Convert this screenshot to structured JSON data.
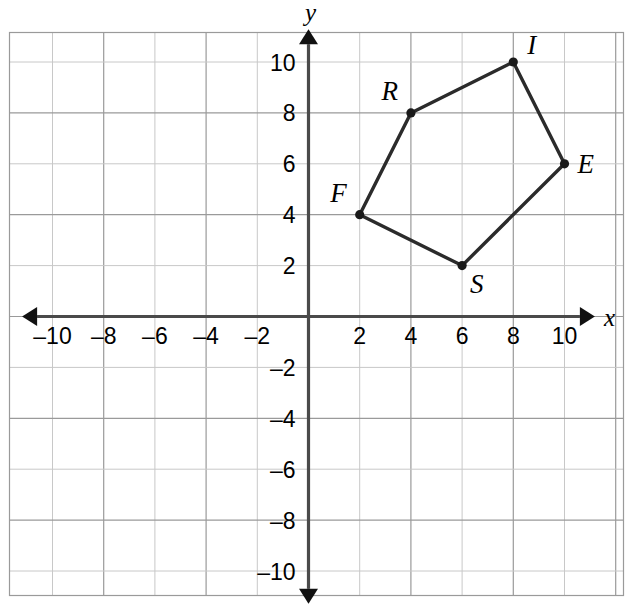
{
  "chart_data": {
    "type": "scatter",
    "title": "",
    "xlabel": "x",
    "ylabel": "y",
    "xlim": [
      -11,
      11
    ],
    "ylim": [
      -11,
      11
    ],
    "grid": true,
    "grid_step": 2,
    "legend": "none",
    "x_ticks": [
      -10,
      -8,
      -6,
      -4,
      -2,
      2,
      4,
      6,
      8,
      10
    ],
    "y_ticks": [
      -10,
      -8,
      -6,
      -4,
      -2,
      2,
      4,
      6,
      8,
      10
    ],
    "x_tick_labels": [
      "–10",
      "–8",
      "–6",
      "–4",
      "–2",
      "2",
      "4",
      "6",
      "8",
      "10"
    ],
    "y_tick_labels": [
      "–10",
      "–8",
      "–6",
      "–4",
      "–2",
      "2",
      "4",
      "6",
      "8",
      "10"
    ],
    "shape_name": "FRISE",
    "closed": true,
    "points": [
      {
        "label": "F",
        "x": 2,
        "y": 4,
        "label_pos": "upper-left"
      },
      {
        "label": "R",
        "x": 4,
        "y": 8,
        "label_pos": "upper-left"
      },
      {
        "label": "I",
        "x": 8,
        "y": 10,
        "label_pos": "upper-right"
      },
      {
        "label": "E",
        "x": 10,
        "y": 6,
        "label_pos": "right"
      },
      {
        "label": "S",
        "x": 6,
        "y": 2,
        "label_pos": "lower-right"
      }
    ],
    "colors": {
      "polygon_stroke": "#2b2b2b",
      "vertex_fill": "#1a1a1a",
      "axis": "#4a4a4a",
      "grid_minor": "#c8c8c8",
      "grid_major": "#9a9a9a",
      "background": "#ffffff"
    }
  },
  "axes": {
    "x_name": "x",
    "y_name": "y"
  }
}
